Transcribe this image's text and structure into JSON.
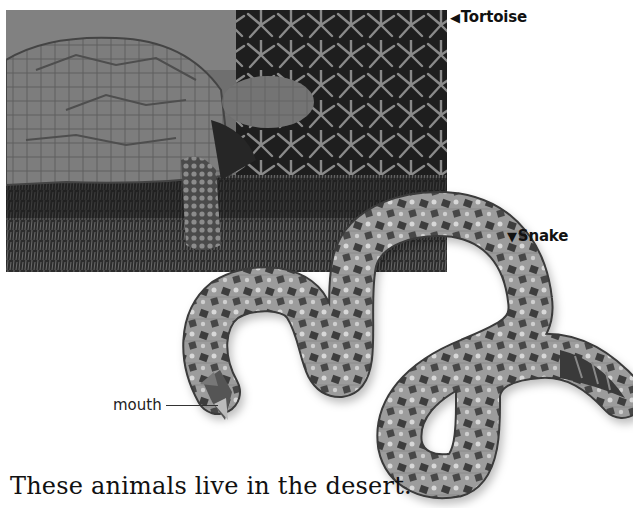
{
  "figure": {
    "photo": {
      "subject": "tortoise",
      "description": "Grayscale photo of a desert tortoise eating leafy plants"
    },
    "illustration": {
      "subject": "snake",
      "description": "Grayscale image of a coiled rattlesnake with an open mouth"
    },
    "labels": {
      "tortoise": {
        "arrow": "◀",
        "text": "Tortoise"
      },
      "snake": {
        "arrow": "▼",
        "text": "Snake"
      },
      "mouth": {
        "text": "mouth"
      }
    },
    "caption": "These animals live in the desert."
  },
  "colors": {
    "text": "#111111",
    "background": "#ffffff",
    "leader_line": "#333333"
  }
}
